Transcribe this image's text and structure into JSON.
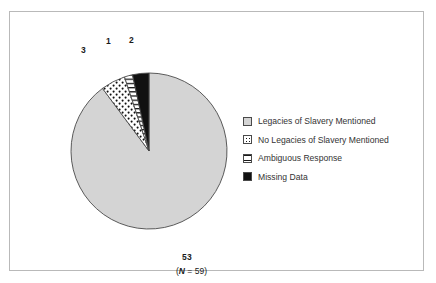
{
  "chart_data": {
    "type": "pie",
    "title": "",
    "subtitle": "",
    "caption_prefix": "(",
    "caption_n_symbol": "N",
    "caption_equals": " = ",
    "caption_total": "59",
    "caption_suffix": ")",
    "total": 59,
    "categories": [
      "Legacies of Slavery Mentioned",
      "No Legacies of Slavery Mentioned",
      "Ambiguous Response",
      "Missing Data"
    ],
    "values": [
      53,
      3,
      1,
      2
    ],
    "data_labels": [
      "53",
      "3",
      "1",
      "2"
    ],
    "fills": [
      "light-gray-solid",
      "white-dotted",
      "white-horizontal-lines",
      "solid-black"
    ],
    "colors": [
      "#d4d4d4",
      "#ffffff",
      "#ffffff",
      "#111111"
    ],
    "outline_color": "#4a4a4a",
    "legend_position": "right",
    "grid": false,
    "xlabel": "",
    "ylabel": ""
  },
  "figure": {
    "border_color": "#b9b9b9",
    "background": "#ffffff"
  },
  "legend": {
    "entries": [
      {
        "label": "Legacies of Slavery Mentioned",
        "swatch": "light-gray-solid"
      },
      {
        "label": "No Legacies of Slavery Mentioned",
        "swatch": "white-dotted"
      },
      {
        "label": "Ambiguous Response",
        "swatch": "white-horizontal-lines"
      },
      {
        "label": "Missing Data",
        "swatch": "solid-black"
      }
    ]
  },
  "slice_labels": {
    "legacies": "53",
    "no_legacies": "3",
    "ambiguous": "1",
    "missing": "2"
  }
}
